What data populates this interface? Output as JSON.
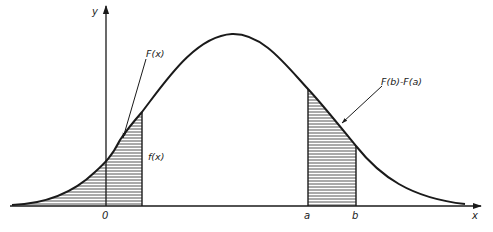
{
  "diagram": {
    "axes": {
      "x_label": "x",
      "y_label": "y",
      "origin_label": "0"
    },
    "markers": {
      "a_label": "a",
      "b_label": "b"
    },
    "annotations": {
      "cdf_label": "F(x)",
      "pdf_label": "f(x)",
      "interval_label": "F(b)-F(a)"
    },
    "colors": {
      "ink": "#1a1a1a",
      "background": "#ffffff"
    }
  }
}
